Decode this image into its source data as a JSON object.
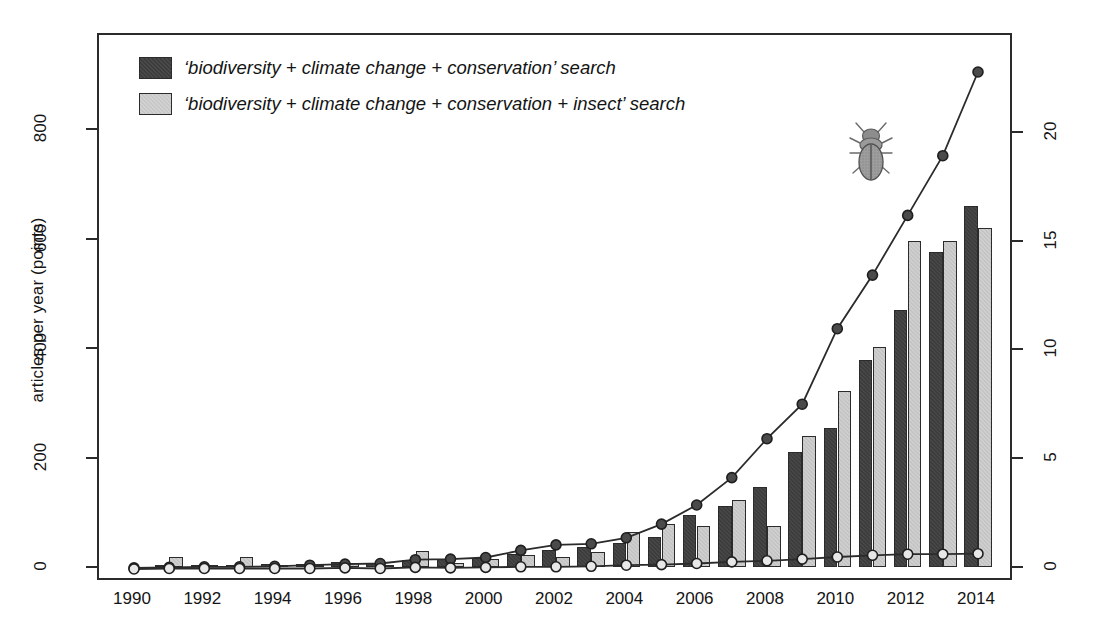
{
  "legend": {
    "position": "top-left inside plot",
    "entries": [
      {
        "label": "‘biodiversity + climate change + conservation’ search",
        "swatch": "dark",
        "color": "#3c3c3c"
      },
      {
        "label": "‘biodiversity + climate change + conservation + insect’ search",
        "swatch": "light",
        "color": "#cfcfcf"
      }
    ]
  },
  "icons": {
    "beetle": "beetle-icon"
  },
  "axes": {
    "left": {
      "title": "articles per year (points)",
      "ticks": [
        0,
        200,
        400,
        600,
        800
      ],
      "tick_labels": [
        "0",
        "200",
        "400",
        "600",
        "800"
      ],
      "range": [
        0,
        950
      ]
    },
    "right": {
      "title": "% of total articles published per year (bars)",
      "ticks": [
        0,
        5,
        10,
        15,
        20
      ],
      "tick_labels": [
        "0",
        "5",
        "10",
        "15",
        "20"
      ],
      "range": [
        0,
        23.9
      ]
    },
    "x": {
      "title": "",
      "tick_labels": [
        "1990",
        "1992",
        "1994",
        "1996",
        "1998",
        "2000",
        "2002",
        "2004",
        "2006",
        "2008",
        "2010",
        "2012",
        "2014"
      ],
      "range": [
        1990,
        2014
      ]
    }
  },
  "chart_data": {
    "type": "bar",
    "title": "",
    "xlabel": "",
    "ylabel": "articles per year (points)",
    "y2label": "% of total articles published per year (bars)",
    "grid": false,
    "legend_position": "top-left",
    "ylim": [
      0,
      950
    ],
    "y2lim": [
      0,
      23.9
    ],
    "categories": [
      1990,
      1991,
      1992,
      1993,
      1994,
      1995,
      1996,
      1997,
      1998,
      1999,
      2000,
      2001,
      2002,
      2003,
      2004,
      2005,
      2006,
      2007,
      2008,
      2009,
      2010,
      2011,
      2012,
      2013,
      2014
    ],
    "series": [
      {
        "name": "'biodiversity + climate change + conservation' search",
        "kind": "bar",
        "axis": "right",
        "unit": "% of total articles published per year",
        "color": "#3c3c3c",
        "values": [
          0.0,
          0.08,
          0.1,
          0.1,
          0.12,
          0.15,
          0.25,
          0.2,
          0.3,
          0.35,
          0.4,
          0.6,
          0.8,
          0.9,
          1.1,
          1.4,
          2.4,
          2.8,
          3.7,
          5.3,
          6.4,
          9.5,
          11.8,
          14.5,
          16.6
        ],
        "bar_px_heights": [
          0,
          2,
          2,
          2,
          3,
          3,
          6,
          5,
          7,
          8,
          9,
          14,
          18,
          21,
          25,
          32,
          55,
          64,
          85,
          121,
          146,
          218,
          270,
          332,
          380
        ]
      },
      {
        "name": "'biodiversity + climate change + conservation + insect' search",
        "kind": "bar",
        "axis": "right",
        "unit": "% of total articles published per year",
        "color": "#cfcfcf",
        "values": [
          0.0,
          0.45,
          0.1,
          0.45,
          0.1,
          0.1,
          0.2,
          0.1,
          0.75,
          0.2,
          0.35,
          0.55,
          0.45,
          0.7,
          1.6,
          2.0,
          1.9,
          3.1,
          1.9,
          6.0,
          8.1,
          10.1,
          15.0,
          15.0,
          15.6
        ],
        "bar_px_heights": [
          0,
          10,
          2,
          10,
          2,
          2,
          5,
          2,
          17,
          5,
          8,
          13,
          10,
          16,
          37,
          46,
          44,
          71,
          44,
          137,
          186,
          231,
          343,
          343,
          357
        ]
      },
      {
        "name": "'biodiversity + climate change + conservation' search",
        "kind": "line-points",
        "axis": "left",
        "unit": "articles per year",
        "color": "#2b2b2b",
        "marker": "filled-circle",
        "values": [
          2,
          3,
          4,
          4,
          5,
          7,
          9,
          10,
          17,
          18,
          21,
          34,
          44,
          46,
          57,
          82,
          117,
          167,
          238,
          301,
          439,
          537,
          646,
          755,
          908
        ]
      },
      {
        "name": "'biodiversity + climate change + conservation + insect' search",
        "kind": "line-points",
        "axis": "left",
        "unit": "articles per year",
        "color": "#2b2b2b",
        "marker": "open-circle",
        "values": [
          0,
          1,
          1,
          1,
          1,
          1,
          2,
          1,
          3,
          2,
          3,
          4,
          4,
          5,
          7,
          8,
          10,
          13,
          15,
          18,
          22,
          25,
          27,
          27,
          28
        ]
      }
    ]
  }
}
